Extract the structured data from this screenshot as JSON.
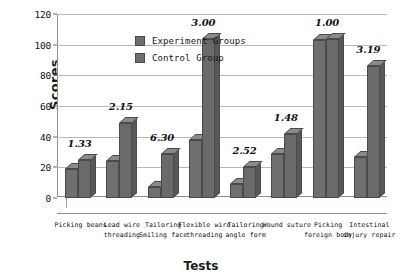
{
  "chart_data": {
    "type": "bar",
    "title": "",
    "xlabel": "Tests",
    "ylabel": "Scores",
    "ylim": [
      0,
      120
    ],
    "yticks": [
      0,
      20,
      40,
      60,
      80,
      100,
      120
    ],
    "grid": true,
    "legend_position": "top-left",
    "categories": [
      "Picking beans",
      "Lead wire threading",
      "Tailoring Smiling face",
      "Flexible wire threading",
      "Tailoring angle form",
      "Wound suture",
      "Picking foreign body",
      "Intestinal injury repair"
    ],
    "category_lines": [
      [
        "Picking beans",
        ""
      ],
      [
        "Lead wire",
        "threading"
      ],
      [
        "Tailoring",
        "Smiling face"
      ],
      [
        "Flexible wire",
        "threading"
      ],
      [
        "Tailoring",
        "angle form"
      ],
      [
        "Wound suture",
        ""
      ],
      [
        "Picking",
        "foreign body"
      ],
      [
        "Intestinal",
        "injury repair"
      ]
    ],
    "series": [
      {
        "name": "Experiment Groups",
        "color": "#6f6f6f",
        "values": [
          19,
          24,
          7,
          38,
          9,
          29,
          103,
          27
        ]
      },
      {
        "name": "Control Group",
        "color": "#6a6a6a",
        "values": [
          25,
          49,
          29,
          104,
          20,
          42,
          104,
          86
        ]
      }
    ],
    "annotations": [
      "1.33",
      "2.15",
      "6.30",
      "3.00",
      "2.52",
      "1.48",
      "1.00",
      "3.19"
    ]
  },
  "legend": {
    "items": [
      {
        "label": "Experiment Groups"
      },
      {
        "label": "Control Group"
      }
    ]
  },
  "axes": {
    "y_title": "Scores",
    "x_title": "Tests"
  }
}
